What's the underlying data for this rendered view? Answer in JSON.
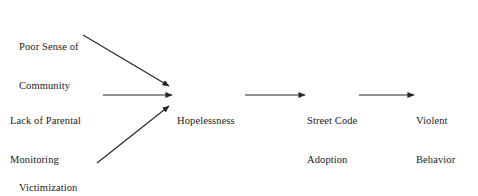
{
  "diagram": {
    "type": "path-model",
    "background_color": "#ffffff",
    "text_color": "#1a1a1a",
    "line_color": "#262626",
    "nodes": [
      {
        "id": "poor-sense",
        "lines": [
          "Poor Sense of",
          "Community"
        ]
      },
      {
        "id": "lack-parental",
        "lines": [
          "Lack of Parental",
          "Monitoring"
        ]
      },
      {
        "id": "victimization",
        "lines": [
          "Victimization",
          "and Threats"
        ]
      },
      {
        "id": "hopelessness",
        "lines": [
          "Hopelessness"
        ]
      },
      {
        "id": "street-code",
        "lines": [
          "Street Code",
          "Adoption"
        ]
      },
      {
        "id": "violent",
        "lines": [
          "Violent",
          "Behavior"
        ]
      }
    ],
    "edges": [
      {
        "id": "poor-sense-to-hopelessness",
        "from": "poor-sense",
        "to": "hopelessness",
        "style": "diagonal-down"
      },
      {
        "id": "lack-parental-to-hopelessness",
        "from": "lack-parental",
        "to": "hopelessness",
        "style": "horizontal"
      },
      {
        "id": "victimization-to-hopelessness",
        "from": "victimization",
        "to": "hopelessness",
        "style": "diagonal-up"
      },
      {
        "id": "hopelessness-to-street-code",
        "from": "hopelessness",
        "to": "street-code",
        "style": "horizontal"
      },
      {
        "id": "street-code-to-violent",
        "from": "street-code",
        "to": "violent",
        "style": "horizontal"
      }
    ]
  }
}
